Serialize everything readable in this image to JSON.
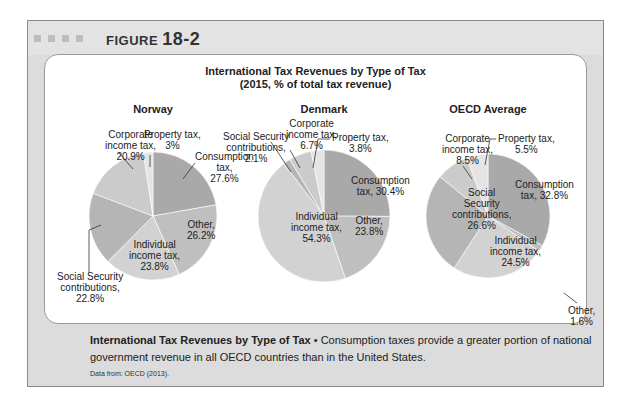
{
  "figure": {
    "label": "FIGURE",
    "number": "18-2"
  },
  "caption": {
    "title": "International Tax Revenues by Type of Tax",
    "bullet": " • ",
    "text": "Consumption taxes provide a greater portion of national government revenue in all OECD countries than in the United States.",
    "source": "Data from: OECD (2013)."
  },
  "colors": {
    "Consumption": "#a9a9a9",
    "Other": "#bfbfbf",
    "Individual": "#d2d2d2",
    "Social": "#b5b5b5",
    "Corporate": "#cbcbcb",
    "Property": "#e4e4e4"
  },
  "chart_data": {
    "type": "pie",
    "title": "International Tax Revenues by Type of Tax",
    "subtitle": "(2015, % of total tax revenue)",
    "charts": [
      {
        "name": "Norway",
        "slices": [
          {
            "key": "Consumption",
            "label": "Consumption tax, 27.6%",
            "value": 27.6
          },
          {
            "key": "Other",
            "label": "Other, 26.2%",
            "value": 26.2
          },
          {
            "key": "Individual",
            "label": "Individual income tax, 23.8%",
            "value": 23.8
          },
          {
            "key": "Social",
            "label": "Social Security contributions, 22.8%",
            "value": 22.8
          },
          {
            "key": "Corporate",
            "label": "Corporate income tax, 20.9%",
            "value": 20.9
          },
          {
            "key": "Property",
            "label": "Property tax, 3%",
            "value": 3
          }
        ]
      },
      {
        "name": "Denmark",
        "slices": [
          {
            "key": "Consumption",
            "label": "Consumption tax, 30.4%",
            "value": 30.4
          },
          {
            "key": "Other",
            "label": "Other, 23.8%",
            "value": 23.8
          },
          {
            "key": "Individual",
            "label": "Individual income tax, 54.3%",
            "value": 54.3
          },
          {
            "key": "Social",
            "label": "Social Security contributions, 2.1%",
            "value": 2.1
          },
          {
            "key": "Corporate",
            "label": "Corporate income tax, 6.7%",
            "value": 6.7
          },
          {
            "key": "Property",
            "label": "Property tax, 3.8%",
            "value": 3.8
          }
        ]
      },
      {
        "name": "OECD Average",
        "slices": [
          {
            "key": "Consumption",
            "label": "Consumption tax, 32.8%",
            "value": 32.8
          },
          {
            "key": "Other",
            "label": "Other, 1.6%",
            "value": 1.6
          },
          {
            "key": "Individual",
            "label": "Individual income tax, 24.5%",
            "value": 24.5
          },
          {
            "key": "Social",
            "label": "Social Security contributions, 26.6%",
            "value": 26.6
          },
          {
            "key": "Corporate",
            "label": "Corporate income tax, 8.5%",
            "value": 8.5
          },
          {
            "key": "Property",
            "label": "Property tax, 5.5%",
            "value": 5.5
          }
        ]
      }
    ]
  },
  "labels": {
    "norway": {
      "corporate": [
        "Corporate",
        "income tax,",
        "20.9%"
      ],
      "property": [
        "Property tax,",
        "3%"
      ],
      "consumption": [
        "Consumption",
        "tax,",
        "27.6%"
      ],
      "other": [
        "Other,",
        "26.2%"
      ],
      "individual": [
        "Individual",
        "income tax,",
        "23.8%"
      ],
      "social": [
        "Social Security",
        "contributions,",
        "22.8%"
      ]
    },
    "denmark": {
      "social": [
        "Social Security",
        "contributions,",
        "2.1%"
      ],
      "corporate": [
        "Corporate",
        "income tax,",
        "6.7%"
      ],
      "property": [
        "Property tax,",
        "3.8%"
      ],
      "consumption": [
        "Consumption",
        "tax, 30.4%"
      ],
      "individual": [
        "Individual",
        "income tax,",
        "54.3%"
      ],
      "other": [
        "Other,",
        "23.8%"
      ]
    },
    "oecd": {
      "corporate": [
        "Corporate",
        "income tax,",
        "8.5%"
      ],
      "property": [
        "Property tax,",
        "5.5%"
      ],
      "consumption": [
        "Consumption",
        "tax, 32.8%"
      ],
      "social": [
        "Social",
        "Security",
        "contributions,",
        "26.6%"
      ],
      "individual": [
        "Individual",
        "income tax,",
        "24.5%"
      ],
      "other": [
        "Other,",
        "1.6%"
      ]
    }
  }
}
